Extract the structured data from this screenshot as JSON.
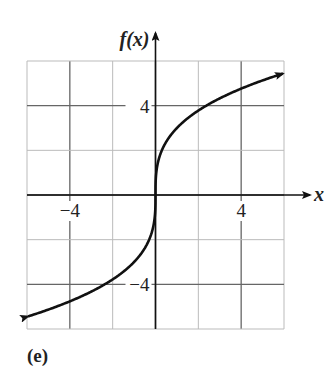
{
  "figure_label": "(e)",
  "chart_data": {
    "type": "line",
    "title": "",
    "xlabel": "x",
    "ylabel": "f(x)",
    "xlim": [
      -6,
      6
    ],
    "ylim": [
      -6,
      6
    ],
    "grid": true,
    "grid_step": 2,
    "x_ticks": [
      {
        "value": -4,
        "label": "−4"
      },
      {
        "value": 4,
        "label": "4"
      }
    ],
    "y_ticks": [
      {
        "value": 4,
        "label": "4"
      },
      {
        "value": -4,
        "label": "−4"
      }
    ],
    "series": [
      {
        "name": "f(x) = 3∛x",
        "arrows_both_ends": true,
        "x": [
          -6,
          -5,
          -4,
          -3,
          -2,
          -1,
          -0.5,
          -0.1,
          0,
          0.1,
          0.5,
          1,
          2,
          3,
          4,
          5,
          6
        ],
        "values": [
          -5.45,
          -5.13,
          -4.76,
          -4.33,
          -3.78,
          -3.0,
          -2.38,
          -1.39,
          0,
          1.39,
          2.38,
          3.0,
          3.78,
          4.33,
          4.76,
          5.13,
          5.45
        ]
      }
    ],
    "legend": null
  }
}
